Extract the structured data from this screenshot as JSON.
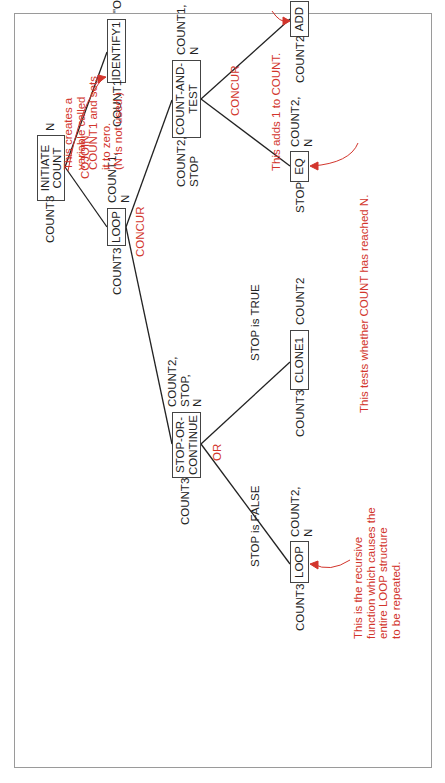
{
  "nodes": {
    "initiate": {
      "label": "INITIATE\nCOUNT",
      "left": "COUNT3",
      "right": "N"
    },
    "identify": {
      "label": "IDENTIFY1",
      "left": "COUNT1",
      "right": "\"O\",N"
    },
    "loop1": {
      "label": "LOOP",
      "left": "COUNT3",
      "right": "COUNT1,\nN"
    },
    "count_test": {
      "label": "COUNT-AND-\nTEST",
      "left": "COUNT2,\nSTOP",
      "right": "COUNT1,\nN"
    },
    "add": {
      "label": "ADD",
      "left": "COUNT2",
      "right": "COUNT1,\n\"1\""
    },
    "eq": {
      "label": "EQ",
      "left": "STOP",
      "right": "COUNT2,\nN"
    },
    "stop_cont": {
      "label": "STOP-OR-\nCONTINUE",
      "left": "COUNT3",
      "right": "COUNT2,\nSTOP,\nN"
    },
    "clone": {
      "label": "CLONE1",
      "left": "COUNT3",
      "right": "COUNT2"
    },
    "loop2": {
      "label": "LOOP",
      "left": "COUNT3",
      "right": "COUNT2,\nN"
    }
  },
  "connectors": {
    "cojoin": "COJOIN",
    "concur1": "CONCUR",
    "concur2": "CONCUR",
    "or": "OR"
  },
  "branch_labels": {
    "stop_true": "STOP is TRUE",
    "stop_false": "STOP is FALSE"
  },
  "annotations": {
    "identify_note": "This creates a\nvariable called\nCOUNT1 and sets\nit to zero.\n(N is not used.)",
    "add_note": "This adds 1 to COUNT.",
    "eq_note": "This tests whether COUNT has reached N.",
    "loop_note": "This is the recursive\nfunction which causes the\nentire LOOP structure\nto be repeated."
  },
  "colors": {
    "annotation": "#d2352c",
    "line": "#222222"
  }
}
